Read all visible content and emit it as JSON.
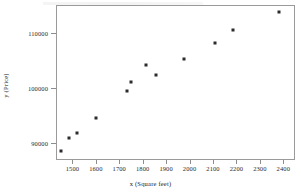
{
  "chart_data": {
    "type": "scatter",
    "title": "",
    "xlabel": "x  (Square feet)",
    "ylabel": "y  (Price)",
    "xlim": [
      1430,
      2450
    ],
    "ylim": [
      87000,
      115000
    ],
    "grid": false,
    "legend": null,
    "xticks": [
      1500,
      1600,
      1700,
      1800,
      1900,
      2000,
      2100,
      2200,
      2300,
      2400
    ],
    "xticklabels": [
      "1500",
      "1600",
      "1700",
      "1800",
      "1900",
      "2000",
      "2100",
      "2200",
      "2300",
      "2400"
    ],
    "yticks": [
      90000,
      100000,
      110000
    ],
    "yticklabels": [
      "90000",
      "100000",
      "110000"
    ],
    "marker": "filled-square",
    "marker_color": "#2b2b2b",
    "points": [
      {
        "x": 1453,
        "y": 88600
      },
      {
        "x": 1487,
        "y": 91000
      },
      {
        "x": 1521,
        "y": 91800
      },
      {
        "x": 1601,
        "y": 94500
      },
      {
        "x": 1733,
        "y": 99400
      },
      {
        "x": 1750,
        "y": 101100
      },
      {
        "x": 1812,
        "y": 104200
      },
      {
        "x": 1858,
        "y": 102400
      },
      {
        "x": 1975,
        "y": 105300
      },
      {
        "x": 2108,
        "y": 108100
      },
      {
        "x": 2186,
        "y": 110400
      },
      {
        "x": 2382,
        "y": 113800
      }
    ]
  },
  "colors": {
    "frame": "#9a9a9a",
    "marker": "#2b2b2b",
    "text": "#222222",
    "background": "#ffffff"
  }
}
